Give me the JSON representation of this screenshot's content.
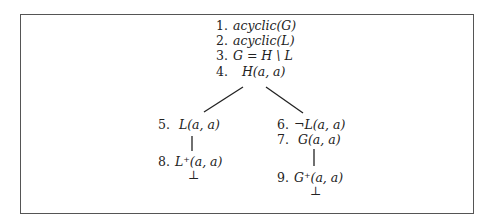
{
  "tree": {
    "root": [
      {
        "num": "1.",
        "formula": "acyclic(G)"
      },
      {
        "num": "2.",
        "formula": "acyclic(L)"
      },
      {
        "num": "3.",
        "formula": "G = H \\ L"
      },
      {
        "num": "4.",
        "formula": "H(a, a)"
      }
    ],
    "left_branch": [
      {
        "num": "5.",
        "formula": "L(a, a)"
      },
      {
        "num": "8.",
        "formula": "L⁺(a, a)"
      }
    ],
    "left_closed": "⊥",
    "right_branch": [
      {
        "num": "6.",
        "formula": "¬L(a, a)"
      },
      {
        "num": "7.",
        "formula": "G(a, a)"
      },
      {
        "num": "9.",
        "formula": "G⁺(a, a)"
      }
    ],
    "right_closed": "⊥"
  }
}
